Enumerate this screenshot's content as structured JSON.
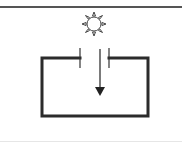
{
  "diagram": {
    "colors": {
      "wire": "#2b2b2b",
      "plate": "#333333",
      "arrow": "#222222",
      "sun_stroke": "#444444",
      "top_rule": "#555555",
      "bottom_rule": "#e6e6e6"
    },
    "elements": {
      "light_source": {
        "icon": "sun-icon",
        "cx": 94,
        "cy": 24,
        "r": 7
      },
      "light_ray": {
        "icon": "arrow-down-icon",
        "x": 100,
        "y1": 49,
        "y2": 96
      },
      "left_plate": {
        "x": 80,
        "y1": 48,
        "y2": 68
      },
      "right_plate": {
        "x": 109,
        "y1": 48,
        "y2": 68
      },
      "circuit": {
        "left": 42,
        "right": 148,
        "top": 58,
        "bottom": 116
      }
    }
  }
}
